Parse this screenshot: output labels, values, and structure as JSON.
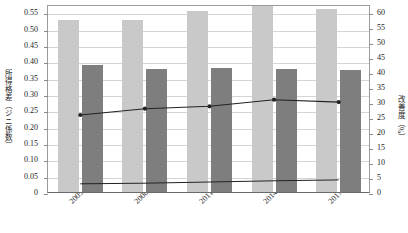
{
  "chart_data": {
    "type": "bar",
    "title": "",
    "subtitle": "",
    "xlabel": "",
    "ylabel": "所得格差（ジニ係数）",
    "y2label": "改善度（%）",
    "categories": [
      "2005年",
      "2008年",
      "2011年",
      "2014年",
      "2017年"
    ],
    "ylim": [
      0,
      0.575
    ],
    "y2lim": [
      0,
      62.8
    ],
    "yticks": [
      "0",
      "0.05",
      "0.10",
      "0.15",
      "0.20",
      "0.25",
      "0.30",
      "0.35",
      "0.40",
      "0.45",
      "0.50",
      "0.55"
    ],
    "ytick_values": [
      0,
      0.05,
      0.1,
      0.15,
      0.2,
      0.25,
      0.3,
      0.35,
      0.4,
      0.45,
      0.5,
      0.55
    ],
    "y2ticks": [
      "0",
      "5",
      "10",
      "15",
      "20",
      "25",
      "30",
      "35",
      "40",
      "45",
      "50",
      "55",
      "60"
    ],
    "y2tick_values": [
      0,
      5,
      10,
      15,
      20,
      25,
      30,
      35,
      40,
      45,
      50,
      55,
      60
    ],
    "grid": true,
    "legend": false,
    "legend_position": "none",
    "series": [
      {
        "name": "当初所得ジニ係数",
        "type": "bar",
        "axis": "left",
        "color": "#c9c9c9",
        "values": [
          0.526,
          0.526,
          0.554,
          0.57,
          0.559
        ]
      },
      {
        "name": "再分配所得ジニ係数",
        "type": "bar",
        "axis": "left",
        "color": "#7e7e7e",
        "values": [
          0.387,
          0.376,
          0.379,
          0.376,
          0.372
        ]
      },
      {
        "name": "改善度（再分配による）",
        "type": "line",
        "axis": "right",
        "color": "#232323",
        "values": [
          26.4,
          28.5,
          29.3,
          31.5,
          30.7
        ]
      },
      {
        "name": "改善度（社会保障以外）",
        "type": "line",
        "axis": "right",
        "color": "#232323",
        "values": [
          3.4,
          3.6,
          4.0,
          4.4,
          4.7
        ]
      }
    ]
  }
}
